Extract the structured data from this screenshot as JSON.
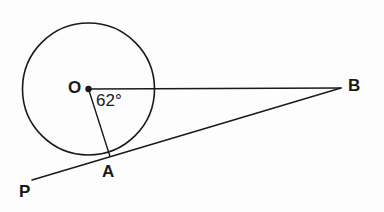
{
  "figure": {
    "background_color": "#fdfdfd",
    "stroke_color": "#1a1a1a",
    "canvas": {
      "width": 384,
      "height": 212
    }
  },
  "labels": {
    "center": "O",
    "tangent_point": "A",
    "external_point": "B",
    "tangent_end": "P",
    "angle": "62°"
  },
  "geometry": {
    "circle": {
      "cx": 88.5,
      "cy": 89,
      "r": 66,
      "stroke_width": 1.6
    },
    "center_dot": {
      "cx": 88.5,
      "cy": 89,
      "r": 3.2
    },
    "points": {
      "O": {
        "x": 88.5,
        "y": 89
      },
      "A": {
        "x": 110,
        "y": 156.5
      },
      "B": {
        "x": 341,
        "y": 88
      },
      "P": {
        "x": 32,
        "y": 180
      }
    },
    "segments": [
      {
        "name": "OB",
        "x1": 88.5,
        "y1": 89,
        "x2": 341,
        "y2": 88,
        "stroke_width": 1.4
      },
      {
        "name": "OA",
        "x1": 88.5,
        "y1": 89,
        "x2": 110,
        "y2": 156.5,
        "stroke_width": 1.4
      },
      {
        "name": "PB",
        "x1": 32,
        "y1": 180,
        "x2": 341,
        "y2": 88,
        "stroke_width": 1.5
      }
    ]
  },
  "label_positions": {
    "O": {
      "left": 68,
      "top": 79,
      "font_size": 17
    },
    "A": {
      "left": 102,
      "top": 163,
      "font_size": 17
    },
    "B": {
      "left": 348,
      "top": 77,
      "font_size": 17
    },
    "P": {
      "left": 19,
      "top": 183,
      "font_size": 17
    },
    "angle": {
      "left": 96,
      "top": 92,
      "font_size": 17
    }
  },
  "chart_data": {
    "type": "diagram",
    "subtype": "euclidean-geometry",
    "elements": [
      {
        "kind": "circle",
        "label": "circle centered at O",
        "center": "O",
        "radius_px": 66
      },
      {
        "kind": "point",
        "label": "O",
        "role": "center of circle",
        "x": 88.5,
        "y": 89
      },
      {
        "kind": "point",
        "label": "A",
        "role": "point of tangency on circle",
        "x": 110,
        "y": 156.5
      },
      {
        "kind": "point",
        "label": "B",
        "role": "external point where OB meets tangent",
        "x": 341,
        "y": 88
      },
      {
        "kind": "point",
        "label": "P",
        "role": "far end of tangent line",
        "x": 32,
        "y": 180
      },
      {
        "kind": "segment",
        "label": "OB",
        "from": "O",
        "to": "B",
        "role": "ray from center through to external point"
      },
      {
        "kind": "segment",
        "label": "OA",
        "from": "O",
        "to": "A",
        "role": "radius to point of tangency"
      },
      {
        "kind": "segment",
        "label": "PB",
        "from": "P",
        "to": "B",
        "role": "tangent line touching circle at A"
      },
      {
        "kind": "angle",
        "label": "62°",
        "value": 62,
        "unit": "degrees",
        "vertex": "O",
        "between": [
          "OA",
          "OB"
        ]
      }
    ]
  }
}
